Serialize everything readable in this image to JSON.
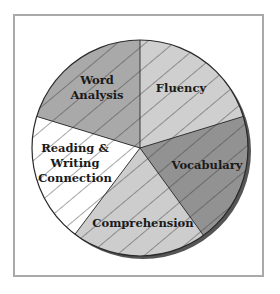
{
  "chart_data": {
    "type": "pie",
    "title": "",
    "slices": [
      {
        "label": "Fluency",
        "value": 20,
        "start_deg": 0,
        "end_deg": 73,
        "color": "#cfcfcf"
      },
      {
        "label": "Vocabulary",
        "value": 20,
        "start_deg": 73,
        "end_deg": 144,
        "color": "#929292"
      },
      {
        "label": "Comprehension",
        "value": 20,
        "start_deg": 144,
        "end_deg": 217,
        "color": "#cdcdcd"
      },
      {
        "label": "Reading & Writing Connection",
        "value": 20,
        "start_deg": 217,
        "end_deg": 287,
        "color": "#ffffff"
      },
      {
        "label": "Word Analysis",
        "value": 20,
        "start_deg": 287,
        "end_deg": 360,
        "color": "#a9a9a9"
      }
    ],
    "hatch": {
      "pattern": "diagonal",
      "color": "#3a3a3a"
    },
    "legend": "none",
    "labels_inside": true
  },
  "labels": {
    "fluency": "Fluency",
    "vocabulary": "Vocabulary",
    "comprehension": "Comprehension",
    "reading_line1": "Reading &",
    "reading_line2": "Writing",
    "reading_line3": "Connection",
    "word_line1": "Word",
    "word_line2": "Analysis"
  },
  "colors": {
    "frame": "#a9a9a9",
    "outline": "#2a2a2a",
    "shadow": "#555555"
  }
}
